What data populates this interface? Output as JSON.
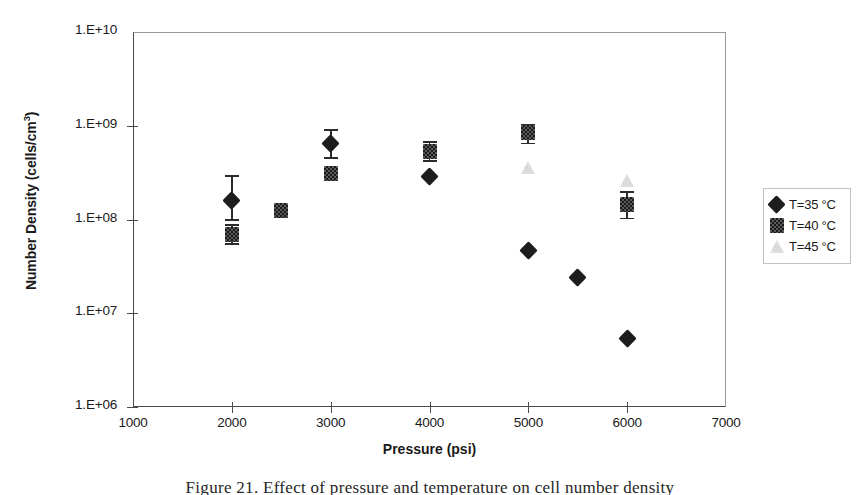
{
  "chart_data": {
    "type": "scatter",
    "title": "",
    "xlabel": "Pressure (psi)",
    "ylabel": "Number Density (cells/cm3)",
    "ylabel_main": "Number Density (cells/cm",
    "ylabel_sup": "3",
    "ylabel_tail": ")",
    "xlim": [
      1000,
      7000
    ],
    "ylim": [
      1000000,
      10000000000
    ],
    "yscale": "log",
    "grid": false,
    "legend_position": "right-outside",
    "xticks": [
      {
        "value": 1000,
        "label": "1000"
      },
      {
        "value": 2000,
        "label": "2000"
      },
      {
        "value": 3000,
        "label": "3000"
      },
      {
        "value": 4000,
        "label": "4000"
      },
      {
        "value": 5000,
        "label": "5000"
      },
      {
        "value": 6000,
        "label": "6000"
      },
      {
        "value": 7000,
        "label": "7000"
      }
    ],
    "yticks": [
      {
        "value": 10000000000,
        "label": "1.E+10"
      },
      {
        "value": 1000000000,
        "label": "1.E+09"
      },
      {
        "value": 100000000,
        "label": "1.E+08"
      },
      {
        "value": 10000000,
        "label": "1.E+07"
      },
      {
        "value": 1000000,
        "label": "1.E+06"
      }
    ],
    "series": [
      {
        "name": "T=35 °C",
        "marker": "diamond",
        "color": "#1d1d1d",
        "points": [
          {
            "x": 2000,
            "y": 160000000.0,
            "yerr_low": 100000000.0,
            "yerr_high": 300000000.0
          },
          {
            "x": 3000,
            "y": 650000000.0,
            "yerr_low": 460000000.0,
            "yerr_high": 920000000.0
          },
          {
            "x": 4000,
            "y": 290000000.0
          },
          {
            "x": 5000,
            "y": 47000000.0
          },
          {
            "x": 5500,
            "y": 24000000.0
          },
          {
            "x": 6000,
            "y": 5400000.0
          }
        ]
      },
      {
        "name": "T=40 °C",
        "marker": "square",
        "color": "#2b2b2b",
        "points": [
          {
            "x": 2000,
            "y": 70000000.0,
            "yerr_low": 56000000.0,
            "yerr_high": 90000000.0
          },
          {
            "x": 2500,
            "y": 125000000.0
          },
          {
            "x": 3000,
            "y": 310000000.0
          },
          {
            "x": 4000,
            "y": 530000000.0,
            "yerr_low": 430000000.0,
            "yerr_high": 680000000.0
          },
          {
            "x": 5000,
            "y": 850000000.0,
            "yerr_low": 660000000.0,
            "yerr_high": 1050000000.0
          },
          {
            "x": 6000,
            "y": 145000000.0,
            "yerr_low": 105000000.0,
            "yerr_high": 200000000.0
          }
        ]
      },
      {
        "name": "T=45 °C",
        "marker": "triangle",
        "color": "#dedede",
        "points": [
          {
            "x": 5000,
            "y": 350000000.0
          },
          {
            "x": 6000,
            "y": 260000000.0
          }
        ]
      }
    ]
  },
  "legend": {
    "items": [
      {
        "label": "T=35 °C",
        "marker": "diamond"
      },
      {
        "label": "T=40 °C",
        "marker": "square"
      },
      {
        "label": "T=45 °C",
        "marker": "triangle"
      }
    ]
  },
  "caption": {
    "text": "Figure 21.  Effect of pressure and temperature on cell number density"
  }
}
